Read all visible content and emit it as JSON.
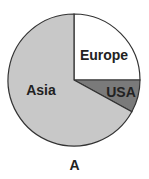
{
  "chart_data": {
    "type": "pie",
    "title": "",
    "caption": "A",
    "labels": [
      "Europe",
      "USA",
      "Asia"
    ],
    "values": [
      25,
      8,
      67
    ],
    "unit": "percent (estimated from slice angles)",
    "colors": [
      "#ffffff",
      "#7a7a7a",
      "#c8c8c8"
    ],
    "start_angle_deg": 0,
    "direction": "clockwise",
    "legend": "none (labels inside slices)"
  },
  "caption": "A",
  "slices": [
    {
      "label": "Europe",
      "value": 25,
      "color": "#ffffff"
    },
    {
      "label": "USA",
      "value": 8,
      "color": "#7a7a7a"
    },
    {
      "label": "Asia",
      "value": 67,
      "color": "#c8c8c8"
    }
  ]
}
